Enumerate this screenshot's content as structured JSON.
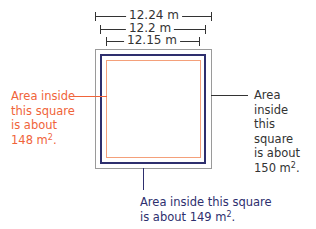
{
  "dimensions": [
    {
      "label": "12.24 m",
      "left": 95,
      "right": 211,
      "y": 16
    },
    {
      "label": "12.2 m",
      "left": 100,
      "right": 205,
      "y": 29
    },
    {
      "label": "12.15 m",
      "left": 106,
      "right": 199,
      "y": 41
    }
  ],
  "squares": {
    "outer": {
      "color": "#9a9a9a"
    },
    "middle": {
      "color": "#2e2f6e"
    },
    "inner": {
      "color": "#f4a07a"
    }
  },
  "labels": {
    "left": {
      "text": "Area inside\nthis square\nis about\n148 m",
      "sup": "2",
      "tail": ".",
      "color": "#f0643a"
    },
    "right": {
      "text": "Area inside\nthis square\nis about\n150 m",
      "sup": "2",
      "tail": ".",
      "color": "#333333"
    },
    "bottom": {
      "line1": "Area inside this square",
      "line2": "is about 149 m",
      "sup": "2",
      "tail": ".",
      "color": "#2e2f6e"
    }
  },
  "colors": {
    "orange": "#f0643a",
    "navy": "#2e2f6e",
    "grey": "#9a9a9a",
    "text": "#333333"
  }
}
